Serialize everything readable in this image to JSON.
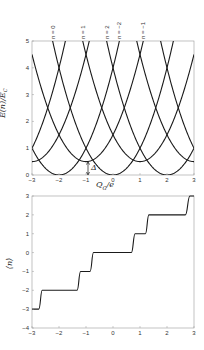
{
  "chart_data": [
    {
      "type": "line",
      "title": "",
      "xlabel": "Q_G/e",
      "ylabel": "E(n)/E_C",
      "xlim": [
        -3,
        3
      ],
      "ylim": [
        0,
        5
      ],
      "xticks": [
        -3,
        -2,
        -1,
        0,
        1,
        2,
        3
      ],
      "yticks": [
        0,
        1,
        2,
        3,
        4,
        5
      ],
      "grid": false,
      "annotation": "Δ",
      "delta": 0.5,
      "series": [
        {
          "name": "n = -4",
          "center": -4,
          "offset": 0
        },
        {
          "name": "n = -3",
          "center": -3,
          "offset": 0.5
        },
        {
          "name": "n = -2",
          "center": -2,
          "offset": 0
        },
        {
          "name": "n = -1",
          "center": -1,
          "offset": 0.5
        },
        {
          "name": "n = 0",
          "center": 0,
          "offset": 0
        },
        {
          "name": "n = 1",
          "center": 1,
          "offset": 0.5
        },
        {
          "name": "n = 2",
          "center": 2,
          "offset": 0
        },
        {
          "name": "n = 3",
          "center": 3,
          "offset": 0.5
        },
        {
          "name": "n = 4",
          "center": 4,
          "offset": 0
        }
      ],
      "curve_labels": [
        {
          "text": "n = 0",
          "x": -2.24
        },
        {
          "text": "n = 1",
          "x": -1.12
        },
        {
          "text": "n = 2",
          "x": -0.24
        },
        {
          "text": "n = −2",
          "x": 0.24
        },
        {
          "text": "n = −1",
          "x": 1.12
        }
      ]
    },
    {
      "type": "line",
      "title": "",
      "xlabel": "",
      "ylabel": "⟨n⟩",
      "xlim": [
        -3,
        3
      ],
      "ylim": [
        -4,
        3
      ],
      "xticks": [
        -3,
        -2,
        -1,
        0,
        1,
        2,
        3
      ],
      "yticks": [
        -4,
        -3,
        -2,
        -1,
        0,
        1,
        2,
        3
      ],
      "grid": false,
      "steps": [
        {
          "level": -3,
          "from": -3,
          "to": -2.75
        },
        {
          "level": -2,
          "from": -2.62,
          "to": -1.33
        },
        {
          "level": -1,
          "from": -1.2,
          "to": -0.85
        },
        {
          "level": 0,
          "from": -0.72,
          "to": 0.68
        },
        {
          "level": 1,
          "from": 0.82,
          "to": 1.2
        },
        {
          "level": 2,
          "from": 1.33,
          "to": 2.68
        },
        {
          "level": 3,
          "from": 2.85,
          "to": 3
        }
      ]
    }
  ],
  "labels": {
    "top_xlabel": "Q",
    "top_xlabel_sub": "G",
    "top_xlabel_rest": "/e",
    "top_ylabel": "E(n)/E",
    "top_ylabel_sub": "C",
    "bottom_ylabel": "⟨n⟩",
    "delta": "Δ"
  }
}
